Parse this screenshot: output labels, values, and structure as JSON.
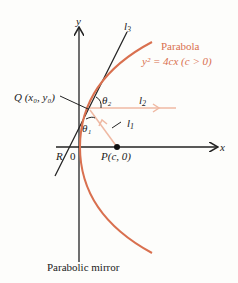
{
  "diagram": {
    "axes": {
      "y_label": "y",
      "x_label": "x"
    },
    "lines": {
      "l3": "l",
      "l3_sub": "3",
      "l2": "l",
      "l2_sub": "2",
      "l1": "l",
      "l1_sub": "1"
    },
    "parabola": {
      "title": "Parabola",
      "equation": "y² = 4cx (c > 0)"
    },
    "points": {
      "Q": "Q (x₀, y₀)",
      "P": "P(c, 0)",
      "R": "R",
      "origin": "0"
    },
    "angles": {
      "theta1": "θ₁",
      "theta2": "θ₂"
    },
    "caption": "Parabolic mirror",
    "colors": {
      "parabola": "#d9704f",
      "rays": "#efb9a3",
      "ink": "#222222"
    }
  }
}
